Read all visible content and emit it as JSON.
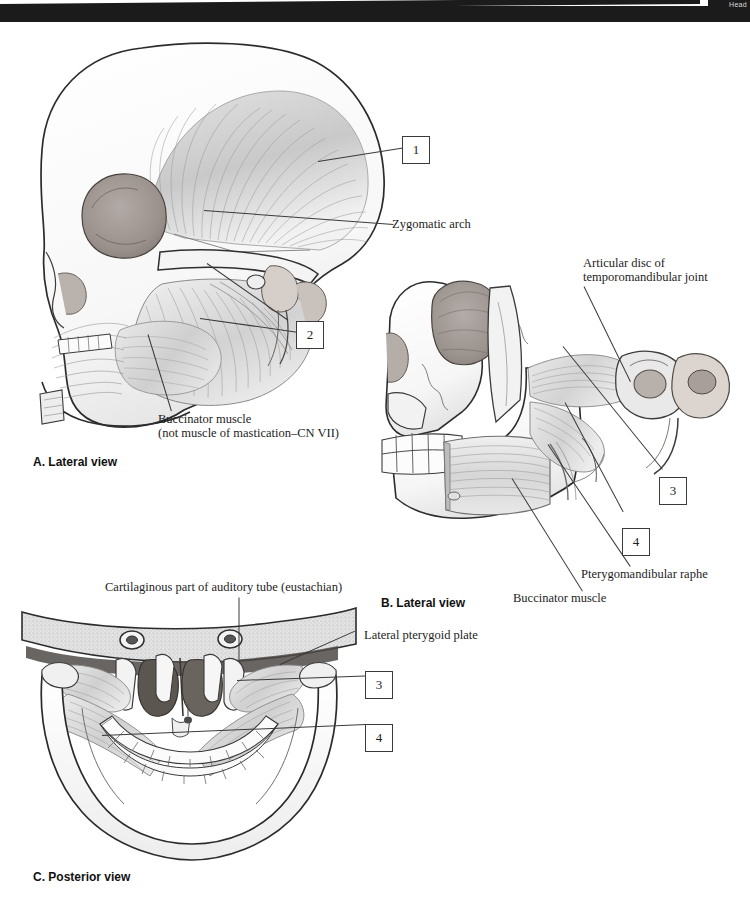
{
  "page": {
    "top_tab_label": "Head",
    "bar_color": "#1b1b1b",
    "ink_color": "#1d1d1d"
  },
  "panels": [
    {
      "id": "A",
      "caption": "A. Lateral view",
      "view": "lateral",
      "description": "Lateral view of skull showing temporalis and masseter muscles"
    },
    {
      "id": "B",
      "caption": "B. Lateral view",
      "view": "lateral",
      "description": "Lateral view with zygomatic arch and masseter removed showing pterygoid muscles"
    },
    {
      "id": "C",
      "caption": "C. Posterior view",
      "view": "posterior",
      "description": "Posterior view of skull showing lateral and medial pterygoid muscles"
    }
  ],
  "labels": {
    "zygomatic_arch": "Zygomatic arch",
    "buccinator_a_line1": "Buccinator muscle",
    "buccinator_a_line2": "(not muscle of mastication–CN VII)",
    "articular_disc_line1": "Articular disc of",
    "articular_disc_line2": "temporomandibular joint",
    "pterygomandibular_raphe": "Pterygomandibular raphe",
    "buccinator_b": "Buccinator muscle",
    "cartilaginous_auditory_tube": "Cartilaginous part of auditory tube (eustachian)",
    "lateral_pterygoid_plate": "Lateral pterygoid plate"
  },
  "numbered_callouts": {
    "a1": "1",
    "a2": "2",
    "b3": "3",
    "b4": "4",
    "c3": "3",
    "c4": "4"
  }
}
